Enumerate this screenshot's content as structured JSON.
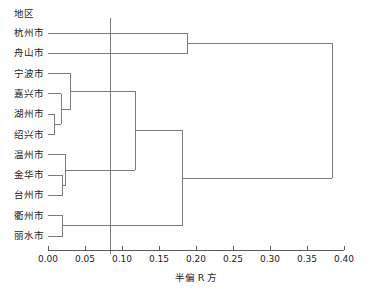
{
  "chart_data": {
    "type": "tree",
    "chart_kind": "dendrogram",
    "title": "",
    "xlabel": "半偏 R 方",
    "ylabel": "",
    "leaf_header": "地区",
    "xlim": [
      0.0,
      0.4
    ],
    "xticks": [
      "0.00",
      "0.05",
      "0.10",
      "0.15",
      "0.20",
      "0.25",
      "0.30",
      "0.35",
      "0.40"
    ],
    "xtick_values": [
      0.0,
      0.05,
      0.1,
      0.15,
      0.2,
      0.25,
      0.3,
      0.35,
      0.4
    ],
    "grid": false,
    "legend": "none",
    "orientation": "horizontal-right",
    "reference_line": {
      "value": 0.084,
      "orientation": "vertical"
    },
    "leaves": [
      {
        "label": "杭州市",
        "order": 1
      },
      {
        "label": "舟山市",
        "order": 2
      },
      {
        "label": "宁波市",
        "order": 3
      },
      {
        "label": "嘉兴市",
        "order": 4
      },
      {
        "label": "湖州市",
        "order": 5
      },
      {
        "label": "绍兴市",
        "order": 6
      },
      {
        "label": "温州市",
        "order": 7
      },
      {
        "label": "金华市",
        "order": 8
      },
      {
        "label": "台州市",
        "order": 9
      },
      {
        "label": "衢州市",
        "order": 10
      },
      {
        "label": "丽水市",
        "order": 11
      }
    ],
    "merges": [
      {
        "id": "m1",
        "children": [
          "湖州市",
          "绍兴市"
        ],
        "height": 0.009
      },
      {
        "id": "m2",
        "children": [
          "嘉兴市",
          "m1"
        ],
        "height": 0.018
      },
      {
        "id": "m3",
        "children": [
          "宁波市",
          "m2"
        ],
        "height": 0.031
      },
      {
        "id": "m4",
        "children": [
          "金华市",
          "台州市"
        ],
        "height": 0.02
      },
      {
        "id": "m5",
        "children": [
          "温州市",
          "m4"
        ],
        "height": 0.024
      },
      {
        "id": "m6",
        "children": [
          "衢州市",
          "丽水市"
        ],
        "height": 0.02
      },
      {
        "id": "m7",
        "children": [
          "m3",
          "m5"
        ],
        "height": 0.118
      },
      {
        "id": "m8",
        "children": [
          "m7",
          "m6"
        ],
        "height": 0.182
      },
      {
        "id": "m9",
        "children": [
          "杭州市",
          "舟山市"
        ],
        "height": 0.189
      },
      {
        "id": "m10",
        "children": [
          "m9",
          "m8"
        ],
        "height": 0.384
      }
    ]
  },
  "style": {
    "line_color": "#6b6b6b",
    "axis_color": "#4a4a4a",
    "text_color": "#1c1c1c",
    "background": "#ffffff"
  }
}
